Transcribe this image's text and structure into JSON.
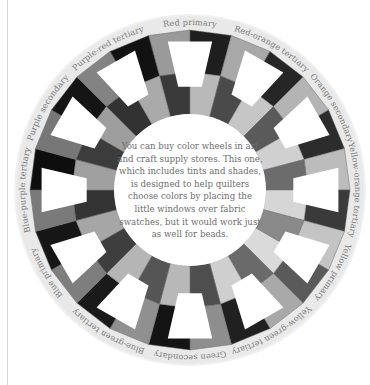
{
  "figure": {
    "type": "photograph",
    "colors": {
      "background": "#ffffff",
      "label_ring": "#e9e9e9",
      "label_text": "#7a7a7a",
      "caption_text": "#6e6e6e"
    }
  },
  "wheel": {
    "segments": [
      {
        "label": "Red primary",
        "angle": 0
      },
      {
        "label": "Red-orange tertiary",
        "angle": 30
      },
      {
        "label": "Orange secondary",
        "angle": 60
      },
      {
        "label": "Yellow-orange tertiary",
        "angle": 90
      },
      {
        "label": "Yellow primary",
        "angle": 120
      },
      {
        "label": "Yellow-green tertiary",
        "angle": 150
      },
      {
        "label": "Green secondary",
        "angle": 180
      },
      {
        "label": "Blue-green tertiary",
        "angle": 210
      },
      {
        "label": "Blue primary",
        "angle": 240
      },
      {
        "label": "Blue-purple tertiary",
        "angle": 270
      },
      {
        "label": "Purple secondary",
        "angle": 300
      },
      {
        "label": "Purple-red tertiary",
        "angle": 330
      }
    ],
    "shades": [
      [
        "#1e1e1e",
        "#3a3a3a",
        "#9a9a9a",
        "#b9b9b9"
      ],
      [
        "#262626",
        "#4a4a4a",
        "#a8a8a8",
        "#c6c6c6"
      ],
      [
        "#2c2c2c",
        "#5a5a5a",
        "#b4b4b4",
        "#d0d0d0"
      ],
      [
        "#3a3a3a",
        "#6c6c6c",
        "#bcbcbc",
        "#d6d6d6"
      ],
      [
        "#5a5a5a",
        "#8a8a8a",
        "#c4c4c4",
        "#dadada"
      ],
      [
        "#202020",
        "#6a6a6a",
        "#a9a9a9",
        "#cfcfcf"
      ],
      [
        "#141414",
        "#4e4e4e",
        "#8e8e8e",
        "#b8b8b8"
      ],
      [
        "#1a1a1a",
        "#555555",
        "#909090",
        "#b5b5b5"
      ],
      [
        "#161616",
        "#3e3e3e",
        "#7e7e7e",
        "#a6a6a6"
      ],
      [
        "#0e0e0e",
        "#343434",
        "#7a7a7a",
        "#a0a0a0"
      ],
      [
        "#151515",
        "#3c3c3c",
        "#777777",
        "#9e9e9e"
      ],
      [
        "#121212",
        "#323232",
        "#838383",
        "#aaaaaa"
      ]
    ]
  },
  "caption": {
    "text": "You can buy color wheels in art and craft supply stores. This one, which includes tints and shades, is designed to help quilters choose colors by placing the little windows over fabric swatches, but it would work just as well for beads."
  }
}
